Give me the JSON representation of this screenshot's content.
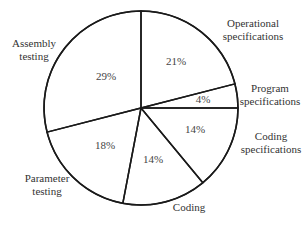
{
  "chart_data": {
    "type": "pie",
    "title": "",
    "start": "top",
    "direction": "clockwise",
    "slices": [
      {
        "label": [
          "Operational",
          "specifications"
        ],
        "value": 21,
        "display": "21%"
      },
      {
        "label": [
          "Program",
          "specifications"
        ],
        "value": 4,
        "display": "4%"
      },
      {
        "label": [
          "Coding",
          "specifications"
        ],
        "value": 14,
        "display": "14%"
      },
      {
        "label": [
          "Coding"
        ],
        "value": 14,
        "display": "14%"
      },
      {
        "label": [
          "Parameter",
          "testing"
        ],
        "value": 18,
        "display": "18%"
      },
      {
        "label": [
          "Assembly",
          "testing"
        ],
        "value": 29,
        "display": "29%"
      }
    ],
    "colors": {
      "stroke": "#1a1a1a",
      "fill": "#ffffff",
      "text": "#333333"
    }
  }
}
